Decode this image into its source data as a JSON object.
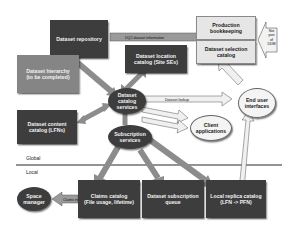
{
  "boxes": {
    "dataset_repository": "Dataset repository",
    "dataset_hierarchy": "Dataset hierarchy\n(to be completed)",
    "dataset_location_catalog": "Dataset location\ncatalog (Site SEs)",
    "production_bookkeeping": "Production\nbookkeeping",
    "dataset_selection_catalog": "Dataset selection\ncatalog",
    "dataset_content_catalog": "Dataset content\ncatalog (LFNs)",
    "claims_catalog": "Claims catalog\n(File usage, lifetime)",
    "dataset_subscription_queue": "Dataset subscription\nqueue",
    "local_replica_catalog": "Local replica catalog\n(LFN -> PFN)"
  },
  "ovals": {
    "dataset_catalog_services": "Dataset\ncatalog\nservices",
    "subscription_services": "Subscription\nservices",
    "end_user_interfaces": "End user\ninterfaces",
    "client_applications": "Client\napplications",
    "space_manager": "Space\nmanager"
  },
  "not_part": "Not\npart\nof\nDDM",
  "regions": {
    "global": "Global",
    "local": "Local"
  },
  "arrow_labels": {
    "dq2_info": "DQ2 dataset information",
    "repository_lookup": "Dataset lookup",
    "content_lookup": "Content lookup",
    "location_lookup": "Location lookup",
    "dataset_lookup": "Dataset lookup",
    "dataset_selection": "Dataset selection",
    "dataset_management": "Dataset management",
    "subscription_management": "Subscription management",
    "claims_management": "Claims management",
    "subscription_queue": "Subscription",
    "replica_management": "Replica management",
    "claims_info": "Claims info",
    "data_access": "Data access"
  },
  "colors": {
    "dark": "#3d3d3d",
    "mid": "#858585",
    "light": "#e6e6e6",
    "arrow": "#8c8c8c"
  }
}
